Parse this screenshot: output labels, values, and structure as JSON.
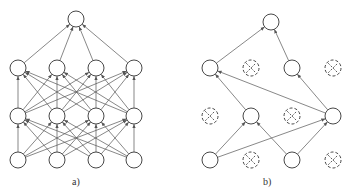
{
  "figure": {
    "panels": [
      {
        "id": "a",
        "label": "a)",
        "label_pos": [
          72,
          176
        ],
        "description": "Standard fully connected neural network",
        "output": [
          76,
          19
        ],
        "layers": [
          {
            "y": 160,
            "xs": [
              18,
              57,
              96,
              134
            ]
          },
          {
            "y": 116,
            "xs": [
              18,
              57,
              96,
              134
            ]
          },
          {
            "y": 68,
            "xs": [
              18,
              57,
              96,
              134
            ]
          }
        ]
      },
      {
        "id": "b",
        "label": "b)",
        "label_pos": [
          263,
          176
        ],
        "description": "Network after applying dropout",
        "output": [
          271,
          22
        ],
        "nodes": [
          {
            "id": "i0",
            "x": 210,
            "y": 160,
            "dropped": false
          },
          {
            "id": "i1",
            "x": 251,
            "y": 160,
            "dropped": true
          },
          {
            "id": "i2",
            "x": 292,
            "y": 160,
            "dropped": false
          },
          {
            "id": "i3",
            "x": 333,
            "y": 160,
            "dropped": true
          },
          {
            "id": "h0",
            "x": 210,
            "y": 116,
            "dropped": true
          },
          {
            "id": "h1",
            "x": 251,
            "y": 116,
            "dropped": false
          },
          {
            "id": "h2",
            "x": 292,
            "y": 116,
            "dropped": true
          },
          {
            "id": "h3",
            "x": 333,
            "y": 116,
            "dropped": false
          },
          {
            "id": "g0",
            "x": 210,
            "y": 68,
            "dropped": false
          },
          {
            "id": "g1",
            "x": 251,
            "y": 68,
            "dropped": true
          },
          {
            "id": "g2",
            "x": 292,
            "y": 68,
            "dropped": false
          },
          {
            "id": "g3",
            "x": 333,
            "y": 68,
            "dropped": true
          }
        ],
        "edges": [
          [
            "i0",
            "h1"
          ],
          [
            "i0",
            "h3"
          ],
          [
            "i2",
            "h1"
          ],
          [
            "i2",
            "h3"
          ],
          [
            "h1",
            "g0"
          ],
          [
            "h3",
            "g0"
          ],
          [
            "h3",
            "g2"
          ],
          [
            "g0",
            "out"
          ],
          [
            "g2",
            "out"
          ]
        ]
      }
    ],
    "node_radius": 8,
    "stroke_color": "#333333",
    "edge_color": "#555555"
  }
}
